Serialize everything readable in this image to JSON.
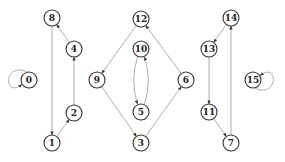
{
  "diagram": {
    "type": "directed-graph",
    "node_radius": 8,
    "nodes": [
      {
        "id": "0",
        "label": "0",
        "x": 29,
        "y": 80
      },
      {
        "id": "1",
        "label": "1",
        "x": 52,
        "y": 143
      },
      {
        "id": "2",
        "label": "2",
        "x": 74,
        "y": 113
      },
      {
        "id": "3",
        "label": "3",
        "x": 141,
        "y": 143
      },
      {
        "id": "4",
        "label": "4",
        "x": 74,
        "y": 49
      },
      {
        "id": "5",
        "label": "5",
        "x": 141,
        "y": 112
      },
      {
        "id": "6",
        "label": "6",
        "x": 186,
        "y": 80
      },
      {
        "id": "7",
        "label": "7",
        "x": 231,
        "y": 143
      },
      {
        "id": "8",
        "label": "8",
        "x": 52,
        "y": 18
      },
      {
        "id": "9",
        "label": "9",
        "x": 97,
        "y": 80
      },
      {
        "id": "10",
        "label": "10",
        "x": 141,
        "y": 49
      },
      {
        "id": "11",
        "label": "11",
        "x": 209,
        "y": 112
      },
      {
        "id": "12",
        "label": "12",
        "x": 141,
        "y": 19
      },
      {
        "id": "13",
        "label": "13",
        "x": 209,
        "y": 49
      },
      {
        "id": "14",
        "label": "14",
        "x": 231,
        "y": 18
      },
      {
        "id": "15",
        "label": "15",
        "x": 253,
        "y": 80
      }
    ],
    "edges": [
      {
        "from": "0",
        "to": "0",
        "self_loop": "left"
      },
      {
        "from": "8",
        "to": "1"
      },
      {
        "from": "1",
        "to": "2"
      },
      {
        "from": "2",
        "to": "4"
      },
      {
        "from": "4",
        "to": "8"
      },
      {
        "from": "12",
        "to": "9"
      },
      {
        "from": "9",
        "to": "3"
      },
      {
        "from": "3",
        "to": "6"
      },
      {
        "from": "6",
        "to": "12"
      },
      {
        "from": "10",
        "to": "5",
        "curve": "left"
      },
      {
        "from": "5",
        "to": "10",
        "curve": "right"
      },
      {
        "from": "14",
        "to": "13"
      },
      {
        "from": "13",
        "to": "11"
      },
      {
        "from": "11",
        "to": "7"
      },
      {
        "from": "7",
        "to": "14"
      },
      {
        "from": "15",
        "to": "15",
        "self_loop": "right"
      }
    ],
    "colors": {
      "node_stroke": "#333333",
      "edge": "#999999",
      "arrowhead": "#333333",
      "background": "#ffffff"
    }
  }
}
